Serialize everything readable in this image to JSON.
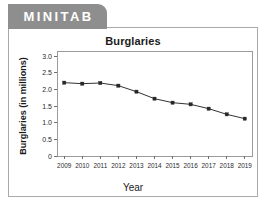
{
  "brand": {
    "name": "MINITAB"
  },
  "card": {
    "title": "Burglaries"
  },
  "axis": {
    "y_title": "Burglaries (in millions)",
    "x_title": "Year"
  },
  "colors": {
    "brand_tab_bg": "#8e8e8e",
    "brand_tab_text": "#ffffff",
    "card_bg": "#ffffff",
    "card_border": "#a9a9a9",
    "plot_frame": "#9a9a9a",
    "series": "#333333",
    "marker": "#262626",
    "text": "#1b1b1b"
  },
  "chart_data": {
    "type": "line",
    "title": "Burglaries",
    "xlabel": "Year",
    "ylabel": "Burglaries (in millions)",
    "x": [
      2009,
      2010,
      2011,
      2012,
      2013,
      2014,
      2015,
      2016,
      2017,
      2018,
      2019
    ],
    "xticklabels": [
      "2009",
      "2010",
      "2011",
      "2012",
      "2013",
      "2014",
      "2015",
      "2016",
      "2017",
      "2018",
      "2019"
    ],
    "values": [
      2.2,
      2.17,
      2.19,
      2.11,
      1.93,
      1.72,
      1.6,
      1.55,
      1.42,
      1.25,
      1.12
    ],
    "yticks": [
      0,
      0.5,
      1.0,
      1.5,
      2.0,
      2.5,
      3.0
    ],
    "yticklabels": [
      "0",
      "0.5",
      "1.0",
      "1.5",
      "2.0",
      "2.5",
      "3.0"
    ],
    "ylim": [
      0,
      3.15
    ],
    "xlim": [
      2008.6,
      2019.4
    ],
    "grid": false,
    "legend": false,
    "marker": "square",
    "series_name": "Burglaries"
  }
}
